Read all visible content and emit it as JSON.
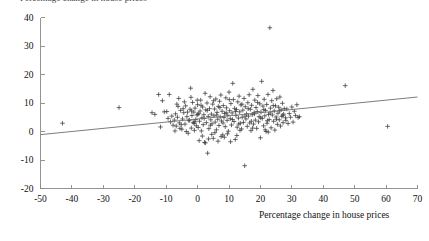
{
  "figure": {
    "clipped_title": "Percentage change in house prices",
    "background_color": "#ffffff"
  },
  "chart_data": {
    "type": "scatter",
    "title": "",
    "xlabel": "Percentage change in house prices",
    "ylabel": "",
    "xlim": [
      -50,
      70
    ],
    "ylim": [
      -20,
      40
    ],
    "xticks": [
      -50,
      -40,
      -30,
      -20,
      -10,
      0,
      10,
      20,
      30,
      40,
      50,
      60,
      70
    ],
    "yticks": [
      -20,
      -10,
      0,
      10,
      20,
      30,
      40
    ],
    "xticklabels": [
      "-50",
      "-40",
      "-30",
      "-20",
      "-10",
      "0",
      "10",
      "20",
      "30",
      "40",
      "50",
      "60",
      "70"
    ],
    "yticklabels": [
      "-20",
      "-10",
      "0",
      "10",
      "20",
      "30",
      "40"
    ],
    "grid": false,
    "legend": null,
    "marker": "plus",
    "marker_color": "#3c3c3c",
    "series": [
      {
        "name": "observations",
        "points": [
          [
            -43.0,
            2.9
          ],
          [
            -25.0,
            8.4
          ],
          [
            -14.5,
            6.6
          ],
          [
            -13.6,
            6.0
          ],
          [
            -12.4,
            13.0
          ],
          [
            -11.8,
            1.6
          ],
          [
            -11.2,
            10.8
          ],
          [
            -10.6,
            6.9
          ],
          [
            -9.8,
            7.0
          ],
          [
            -9.4,
            4.6
          ],
          [
            -9.0,
            13.0
          ],
          [
            -8.6,
            3.4
          ],
          [
            -8.2,
            5.4
          ],
          [
            -7.8,
            2.2
          ],
          [
            -7.4,
            4.0
          ],
          [
            -7.0,
            6.2
          ],
          [
            -6.8,
            1.9
          ],
          [
            -6.4,
            5.0
          ],
          [
            -6.0,
            11.6
          ],
          [
            -5.8,
            3.0
          ],
          [
            -5.4,
            7.4
          ],
          [
            -5.0,
            0.8
          ],
          [
            -4.8,
            4.4
          ],
          [
            -4.4,
            6.6
          ],
          [
            -4.0,
            2.6
          ],
          [
            -3.8,
            9.0
          ],
          [
            -3.4,
            5.2
          ],
          [
            -3.0,
            -0.6
          ],
          [
            -2.8,
            3.8
          ],
          [
            -2.4,
            7.8
          ],
          [
            -2.2,
            15.2
          ],
          [
            -2.0,
            1.2
          ],
          [
            -1.8,
            5.6
          ],
          [
            -1.6,
            10.2
          ],
          [
            -1.4,
            3.2
          ],
          [
            -1.2,
            6.8
          ],
          [
            -1.0,
            0.4
          ],
          [
            -0.8,
            8.2
          ],
          [
            -0.6,
            4.2
          ],
          [
            -0.4,
            2.0
          ],
          [
            -0.2,
            5.8
          ],
          [
            0.0,
            9.4
          ],
          [
            0.2,
            1.4
          ],
          [
            0.4,
            6.4
          ],
          [
            0.6,
            3.6
          ],
          [
            0.8,
            7.2
          ],
          [
            1.0,
            11.0
          ],
          [
            1.2,
            0.2
          ],
          [
            1.4,
            4.8
          ],
          [
            1.6,
            8.6
          ],
          [
            1.8,
            2.4
          ],
          [
            2.0,
            5.9
          ],
          [
            2.2,
            -3.8
          ],
          [
            2.4,
            13.4
          ],
          [
            2.6,
            7.6
          ],
          [
            2.8,
            3.1
          ],
          [
            3.0,
            10.0
          ],
          [
            3.2,
            -7.6
          ],
          [
            3.4,
            5.3
          ],
          [
            3.6,
            1.0
          ],
          [
            3.8,
            8.0
          ],
          [
            4.0,
            12.2
          ],
          [
            4.2,
            4.1
          ],
          [
            4.4,
            6.1
          ],
          [
            4.6,
            2.7
          ],
          [
            4.8,
            9.6
          ],
          [
            5.0,
            -2.4
          ],
          [
            5.2,
            5.5
          ],
          [
            5.4,
            7.9
          ],
          [
            5.6,
            3.3
          ],
          [
            5.8,
            11.4
          ],
          [
            6.0,
            0.6
          ],
          [
            6.2,
            6.7
          ],
          [
            6.4,
            4.3
          ],
          [
            6.6,
            8.8
          ],
          [
            6.8,
            2.1
          ],
          [
            7.0,
            10.6
          ],
          [
            7.2,
            5.1
          ],
          [
            7.4,
            12.8
          ],
          [
            7.6,
            3.7
          ],
          [
            7.8,
            7.1
          ],
          [
            8.0,
            -1.2
          ],
          [
            8.2,
            9.1
          ],
          [
            8.4,
            4.9
          ],
          [
            8.6,
            6.3
          ],
          [
            8.8,
            1.7
          ],
          [
            9.0,
            11.8
          ],
          [
            9.2,
            8.3
          ],
          [
            9.4,
            3.9
          ],
          [
            9.6,
            5.7
          ],
          [
            9.8,
            0.1
          ],
          [
            10.0,
            13.8
          ],
          [
            10.2,
            7.3
          ],
          [
            10.4,
            4.5
          ],
          [
            10.6,
            9.8
          ],
          [
            10.8,
            2.3
          ],
          [
            11.0,
            6.5
          ],
          [
            11.2,
            16.9
          ],
          [
            11.4,
            11.2
          ],
          [
            11.6,
            3.5
          ],
          [
            11.8,
            8.1
          ],
          [
            12.0,
            -2.8
          ],
          [
            12.2,
            5.6
          ],
          [
            12.4,
            7.7
          ],
          [
            12.6,
            1.5
          ],
          [
            12.8,
            10.4
          ],
          [
            13.0,
            4.7
          ],
          [
            13.2,
            12.4
          ],
          [
            13.4,
            6.9
          ],
          [
            13.6,
            2.9
          ],
          [
            13.8,
            9.3
          ],
          [
            14.0,
            0.9
          ],
          [
            14.2,
            5.0
          ],
          [
            14.4,
            7.5
          ],
          [
            14.6,
            3.2
          ],
          [
            14.8,
            11.6
          ],
          [
            15.0,
            -12.0
          ],
          [
            15.2,
            8.7
          ],
          [
            15.4,
            4.4
          ],
          [
            15.6,
            6.2
          ],
          [
            15.8,
            1.8
          ],
          [
            16.0,
            10.1
          ],
          [
            16.2,
            5.4
          ],
          [
            16.4,
            12.9
          ],
          [
            16.6,
            3.0
          ],
          [
            16.8,
            7.8
          ],
          [
            17.0,
            0.3
          ],
          [
            17.2,
            9.2
          ],
          [
            17.4,
            5.9
          ],
          [
            17.6,
            14.8
          ],
          [
            17.8,
            2.6
          ],
          [
            18.0,
            6.6
          ],
          [
            18.2,
            11.0
          ],
          [
            18.4,
            4.0
          ],
          [
            18.6,
            8.4
          ],
          [
            18.8,
            1.1
          ],
          [
            19.0,
            7.0
          ],
          [
            19.2,
            12.6
          ],
          [
            19.4,
            3.4
          ],
          [
            19.6,
            5.2
          ],
          [
            19.8,
            9.7
          ],
          [
            20.0,
            -2.2
          ],
          [
            20.2,
            6.8
          ],
          [
            20.4,
            17.6
          ],
          [
            20.6,
            4.6
          ],
          [
            20.8,
            8.9
          ],
          [
            21.0,
            2.0
          ],
          [
            21.2,
            11.3
          ],
          [
            21.4,
            5.5
          ],
          [
            21.6,
            7.4
          ],
          [
            21.8,
            0.0
          ],
          [
            22.0,
            9.5
          ],
          [
            22.2,
            3.8
          ],
          [
            22.4,
            13.0
          ],
          [
            22.6,
            6.0
          ],
          [
            22.8,
            4.2
          ],
          [
            23.0,
            36.4
          ],
          [
            23.2,
            8.2
          ],
          [
            23.4,
            1.3
          ],
          [
            23.6,
            10.8
          ],
          [
            23.8,
            5.8
          ],
          [
            24.0,
            14.4
          ],
          [
            24.2,
            3.6
          ],
          [
            24.4,
            7.2
          ],
          [
            24.6,
            0.5
          ],
          [
            24.8,
            9.0
          ],
          [
            25.0,
            5.1
          ],
          [
            25.2,
            11.5
          ],
          [
            25.4,
            2.5
          ],
          [
            25.6,
            6.4
          ],
          [
            25.8,
            8.5
          ],
          [
            26.0,
            4.1
          ],
          [
            26.2,
            12.1
          ],
          [
            26.4,
            1.9
          ],
          [
            26.6,
            7.6
          ],
          [
            26.8,
            5.3
          ],
          [
            27.0,
            9.9
          ],
          [
            27.2,
            3.1
          ],
          [
            27.4,
            6.1
          ],
          [
            27.6,
            8.0
          ],
          [
            28.0,
            4.8
          ],
          [
            28.4,
            7.9
          ],
          [
            28.8,
            2.8
          ],
          [
            29.2,
            6.3
          ],
          [
            29.6,
            5.0
          ],
          [
            30.0,
            8.6
          ],
          [
            30.4,
            3.3
          ],
          [
            30.8,
            7.1
          ],
          [
            31.2,
            5.6
          ],
          [
            31.6,
            9.4
          ],
          [
            32.0,
            4.9
          ],
          [
            32.4,
            5.2
          ],
          [
            47.0,
            16.1
          ],
          [
            60.5,
            1.8
          ],
          [
            -6.2,
            8.8
          ],
          [
            -5.2,
            2.4
          ],
          [
            -4.2,
            10.4
          ],
          [
            -3.2,
            6.8
          ],
          [
            -2.6,
            4.0
          ],
          [
            -1.9,
            7.2
          ],
          [
            -0.9,
            3.4
          ],
          [
            0.1,
            6.0
          ],
          [
            1.1,
            9.2
          ],
          [
            2.1,
            4.6
          ],
          [
            3.1,
            7.4
          ],
          [
            4.1,
            2.2
          ],
          [
            5.1,
            10.8
          ],
          [
            6.1,
            5.8
          ],
          [
            7.1,
            8.4
          ],
          [
            8.1,
            3.0
          ],
          [
            9.1,
            6.6
          ],
          [
            10.1,
            11.2
          ],
          [
            11.1,
            4.2
          ],
          [
            12.1,
            7.0
          ],
          [
            13.1,
            2.6
          ],
          [
            14.1,
            9.6
          ],
          [
            15.1,
            5.4
          ],
          [
            16.1,
            8.0
          ],
          [
            17.1,
            3.6
          ],
          [
            18.1,
            6.2
          ],
          [
            19.1,
            10.2
          ],
          [
            20.1,
            4.8
          ],
          [
            21.1,
            7.7
          ],
          [
            22.1,
            2.9
          ],
          [
            23.1,
            6.5
          ],
          [
            24.1,
            9.1
          ],
          [
            25.1,
            4.3
          ],
          [
            26.1,
            7.3
          ],
          [
            27.1,
            5.7
          ],
          [
            28.1,
            3.9
          ],
          [
            0.5,
            -3.2
          ],
          [
            1.5,
            -1.6
          ],
          [
            2.5,
            -4.0
          ],
          [
            4.5,
            -1.0
          ],
          [
            6.5,
            -3.4
          ],
          [
            8.5,
            -2.0
          ],
          [
            10.5,
            -3.6
          ],
          [
            12.5,
            -1.4
          ],
          [
            3.5,
            -2.6
          ],
          [
            5.5,
            -0.4
          ],
          [
            7.5,
            -1.8
          ],
          [
            9.5,
            -0.8
          ],
          [
            -7.2,
            0.2
          ],
          [
            -6.6,
            9.6
          ],
          [
            -5.6,
            1.1
          ],
          [
            -4.6,
            8.0
          ],
          [
            -3.6,
            0.0
          ],
          [
            -2.1,
            12.0
          ],
          [
            -1.1,
            2.8
          ],
          [
            -0.1,
            11.0
          ],
          [
            13.5,
            0.4
          ],
          [
            17.5,
            1.2
          ],
          [
            21.5,
            0.6
          ],
          [
            22.5,
            -0.2
          ]
        ]
      }
    ],
    "trendline": {
      "name": "linear fit",
      "x_start": -50,
      "y_start": -1.1,
      "x_end": 70,
      "y_end": 12.1,
      "color": "#6e6e6e"
    }
  }
}
